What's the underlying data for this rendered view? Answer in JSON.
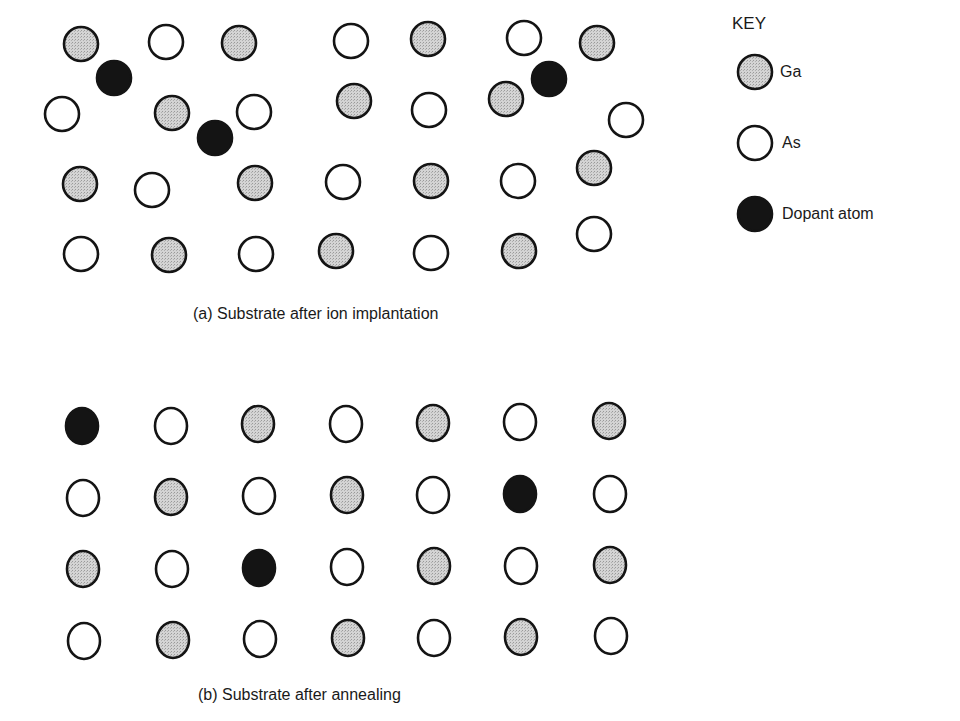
{
  "colors": {
    "ga_fill": "#c8c8c8",
    "as_fill": "#ffffff",
    "dopant_fill": "#141414",
    "stroke": "#141414"
  },
  "key": {
    "title": "KEY",
    "items": [
      {
        "type": "ga",
        "label": "Ga"
      },
      {
        "type": "as",
        "label": "As"
      },
      {
        "type": "dopant",
        "label": "Dopant atom"
      }
    ]
  },
  "panel_a": {
    "caption": "(a) Substrate after ion implantation",
    "atoms": [
      {
        "type": "ga",
        "x": 81,
        "y": 44
      },
      {
        "type": "as",
        "x": 166,
        "y": 42
      },
      {
        "type": "ga",
        "x": 239,
        "y": 43
      },
      {
        "type": "as",
        "x": 351,
        "y": 41
      },
      {
        "type": "ga",
        "x": 428,
        "y": 39
      },
      {
        "type": "as",
        "x": 524,
        "y": 38
      },
      {
        "type": "ga",
        "x": 597,
        "y": 43
      },
      {
        "type": "dopant",
        "x": 114,
        "y": 78
      },
      {
        "type": "dopant",
        "x": 549,
        "y": 79
      },
      {
        "type": "as",
        "x": 62,
        "y": 114
      },
      {
        "type": "ga",
        "x": 172,
        "y": 113
      },
      {
        "type": "as",
        "x": 254,
        "y": 112
      },
      {
        "type": "ga",
        "x": 354,
        "y": 101
      },
      {
        "type": "as",
        "x": 429,
        "y": 110
      },
      {
        "type": "ga",
        "x": 506,
        "y": 99
      },
      {
        "type": "dopant",
        "x": 215,
        "y": 138
      },
      {
        "type": "as",
        "x": 626,
        "y": 120
      },
      {
        "type": "ga",
        "x": 80,
        "y": 184
      },
      {
        "type": "as",
        "x": 152,
        "y": 190
      },
      {
        "type": "ga",
        "x": 255,
        "y": 183
      },
      {
        "type": "as",
        "x": 343,
        "y": 182
      },
      {
        "type": "ga",
        "x": 431,
        "y": 181
      },
      {
        "type": "as",
        "x": 518,
        "y": 181
      },
      {
        "type": "ga",
        "x": 594,
        "y": 168
      },
      {
        "type": "as",
        "x": 81,
        "y": 254
      },
      {
        "type": "ga",
        "x": 169,
        "y": 255
      },
      {
        "type": "as",
        "x": 256,
        "y": 254
      },
      {
        "type": "ga",
        "x": 336,
        "y": 251
      },
      {
        "type": "as",
        "x": 431,
        "y": 253
      },
      {
        "type": "ga",
        "x": 519,
        "y": 251
      },
      {
        "type": "as",
        "x": 594,
        "y": 234
      }
    ]
  },
  "panel_b": {
    "caption": "(b) Substrate after annealing",
    "atoms": [
      {
        "type": "dopant",
        "x": 82,
        "y": 426
      },
      {
        "type": "as",
        "x": 171,
        "y": 426
      },
      {
        "type": "ga",
        "x": 258,
        "y": 424
      },
      {
        "type": "as",
        "x": 346,
        "y": 424
      },
      {
        "type": "ga",
        "x": 433,
        "y": 423
      },
      {
        "type": "as",
        "x": 520,
        "y": 422
      },
      {
        "type": "ga",
        "x": 609,
        "y": 421
      },
      {
        "type": "as",
        "x": 83,
        "y": 498
      },
      {
        "type": "ga",
        "x": 171,
        "y": 497
      },
      {
        "type": "as",
        "x": 259,
        "y": 496
      },
      {
        "type": "ga",
        "x": 347,
        "y": 495
      },
      {
        "type": "as",
        "x": 433,
        "y": 495
      },
      {
        "type": "dopant",
        "x": 520,
        "y": 494
      },
      {
        "type": "as",
        "x": 610,
        "y": 494
      },
      {
        "type": "ga",
        "x": 83,
        "y": 569
      },
      {
        "type": "as",
        "x": 172,
        "y": 569
      },
      {
        "type": "dopant",
        "x": 259,
        "y": 568
      },
      {
        "type": "as",
        "x": 347,
        "y": 567
      },
      {
        "type": "ga",
        "x": 434,
        "y": 566
      },
      {
        "type": "as",
        "x": 521,
        "y": 566
      },
      {
        "type": "ga",
        "x": 610,
        "y": 565
      },
      {
        "type": "as",
        "x": 84,
        "y": 641
      },
      {
        "type": "ga",
        "x": 173,
        "y": 640
      },
      {
        "type": "as",
        "x": 260,
        "y": 639
      },
      {
        "type": "ga",
        "x": 348,
        "y": 638
      },
      {
        "type": "as",
        "x": 434,
        "y": 638
      },
      {
        "type": "ga",
        "x": 521,
        "y": 637
      },
      {
        "type": "as",
        "x": 611,
        "y": 636
      }
    ]
  }
}
